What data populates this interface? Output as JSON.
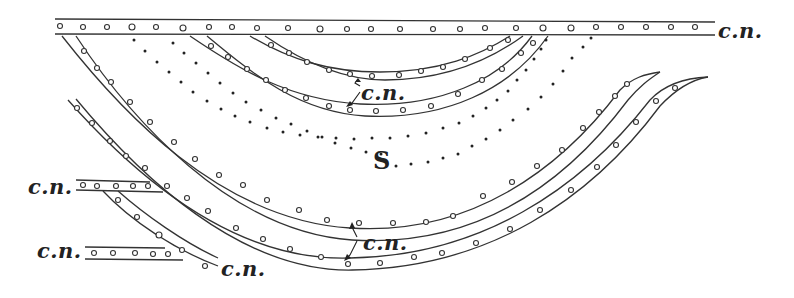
{
  "figure": {
    "region_label": "S",
    "labels": [
      {
        "id": "top-right",
        "text": "c.n.",
        "x": 718,
        "y": 20
      },
      {
        "id": "inner-arrow",
        "text": "c.n.",
        "x": 360,
        "y": 83
      },
      {
        "id": "lower-arrow",
        "text": "c.n.",
        "x": 362,
        "y": 233
      },
      {
        "id": "left-upper",
        "text": "c.n.",
        "x": 30,
        "y": 177
      },
      {
        "id": "left-lower",
        "text": "c.n.",
        "x": 38,
        "y": 240
      },
      {
        "id": "bottom-branch",
        "text": "c.n.",
        "x": 222,
        "y": 260
      }
    ],
    "s_label": {
      "text": "S",
      "x": 372,
      "y": 160
    },
    "colors": {
      "ink": "#222222",
      "paper": "#ffffff"
    }
  }
}
